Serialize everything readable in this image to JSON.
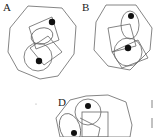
{
  "figure": {
    "panels": [
      {
        "id": "A",
        "label": "A"
      },
      {
        "id": "B",
        "label": "B"
      },
      {
        "id": "D",
        "label": "D"
      }
    ],
    "stroke_color": "#555555",
    "dot_color": "#111111"
  }
}
